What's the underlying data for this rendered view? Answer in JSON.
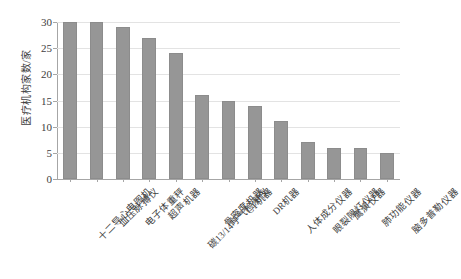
{
  "chart_data": {
    "type": "bar",
    "title": "",
    "xlabel": "",
    "ylabel": "医疗机构家数/家",
    "ylim": [
      0,
      30
    ],
    "ytick_labels": [
      "30",
      "25",
      "20",
      "15",
      "10",
      "5",
      "0"
    ],
    "ytick_values": [
      30,
      25,
      20,
      15,
      10,
      5,
      0
    ],
    "grid": true,
    "legend": null,
    "bar_color": "#969696",
    "categories": [
      "十二导心电图机",
      "血压脉搏仪",
      "电子体重秤",
      "超声机器",
      "碳13/14呼气检测仪",
      "骨密度机器",
      "CT机器",
      "DR机器",
      "人体成分仪器",
      "眼裂隙灯仪器",
      "鹰演仪器",
      "肺功能仪器",
      "脑多普勒仪器"
    ],
    "values": [
      30,
      30,
      29,
      27,
      24,
      16,
      15,
      14,
      11,
      7,
      6,
      6,
      5
    ]
  }
}
